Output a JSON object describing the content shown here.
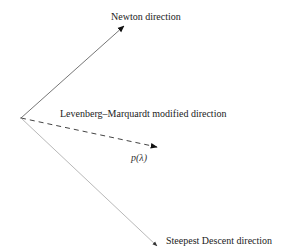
{
  "diagram": {
    "origin": {
      "x": 21,
      "y": 118
    },
    "arrows": [
      {
        "id": "newton",
        "label": "Newton direction",
        "style": "solid",
        "color": "#555555",
        "tip": {
          "x": 124,
          "y": 26
        },
        "label_pos": {
          "x": 111,
          "y": 20
        }
      },
      {
        "id": "lm",
        "label": "Levenberg–Marquardt modified direction",
        "style": "dashed",
        "color": "#444444",
        "tip": {
          "x": 157,
          "y": 147
        },
        "label_pos": {
          "x": 60,
          "y": 117
        }
      },
      {
        "id": "steepest",
        "label": "Steepest Descent direction",
        "style": "solid",
        "color": "#aaaaaa",
        "tip": {
          "x": 157,
          "y": 246
        },
        "label_pos": {
          "x": 166,
          "y": 244
        }
      }
    ],
    "vector_label": {
      "text": "p(λ)",
      "pos": {
        "x": 131,
        "y": 161
      }
    }
  }
}
